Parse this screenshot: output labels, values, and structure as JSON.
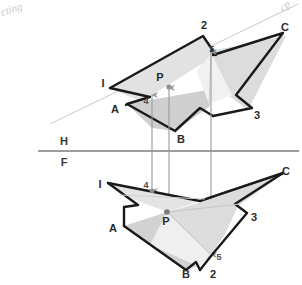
{
  "sheet": {
    "background_color": "#ffffff",
    "width": 302,
    "height": 285,
    "title": "Descriptive geometry: two views of two intersecting planes with piercing point P"
  },
  "colors": {
    "outline": "#1a1a1a",
    "light_fill": "#e3e3e3",
    "mid_fill": "#cfcfcf",
    "dark_fill": "#bdbdbd",
    "pale_fill": "#f0f0f0",
    "projector": "#9a9a9a",
    "reference_line": "#7d7d7d",
    "trace_line": "#c0c0c0",
    "label_text": "#2b2b2b",
    "pencil_scribble": "#c9c9c9"
  },
  "reference_line": {
    "name": "H-F fold line",
    "upper_label": "H",
    "lower_label": "F",
    "y": 151,
    "x_start": 38,
    "x_end": 299,
    "upper_label_x": 64,
    "upper_label_y": 142,
    "lower_label_x": 64,
    "lower_label_y": 162
  },
  "top_view": {
    "name": "horizontal-projection",
    "labels": [
      {
        "text": "2",
        "x": 204,
        "y": 26,
        "size": "large"
      },
      {
        "text": "C",
        "x": 285,
        "y": 28,
        "size": "large"
      },
      {
        "text": "5",
        "x": 212,
        "y": 50,
        "size": "small"
      },
      {
        "text": "I",
        "x": 103,
        "y": 84,
        "size": "large"
      },
      {
        "text": "P",
        "x": 160,
        "y": 78,
        "size": "large"
      },
      {
        "text": "A",
        "x": 115,
        "y": 110,
        "size": "large"
      },
      {
        "text": "4",
        "x": 146,
        "y": 102,
        "size": "small"
      },
      {
        "text": "3",
        "x": 257,
        "y": 116,
        "size": "large"
      },
      {
        "text": "B",
        "x": 181,
        "y": 140,
        "size": "large"
      }
    ],
    "piercing_point": {
      "label": "P",
      "x": 168,
      "y": 87
    }
  },
  "front_view": {
    "name": "frontal-projection",
    "labels": [
      {
        "text": "C",
        "x": 286,
        "y": 172,
        "size": "large"
      },
      {
        "text": "I",
        "x": 100,
        "y": 185,
        "size": "large"
      },
      {
        "text": "4",
        "x": 146,
        "y": 186,
        "size": "small"
      },
      {
        "text": "3",
        "x": 254,
        "y": 218,
        "size": "large"
      },
      {
        "text": "P",
        "x": 166,
        "y": 222,
        "size": "large"
      },
      {
        "text": "A",
        "x": 113,
        "y": 229,
        "size": "large"
      },
      {
        "text": "5",
        "x": 219,
        "y": 258,
        "size": "small"
      },
      {
        "text": "B",
        "x": 186,
        "y": 275,
        "size": "large"
      },
      {
        "text": "2",
        "x": 213,
        "y": 275,
        "size": "large"
      }
    ],
    "piercing_point": {
      "label": "P",
      "x": 167,
      "y": 212
    }
  },
  "projectors": [
    {
      "name": "projector-point-4",
      "x": 152,
      "top_y": 95,
      "bottom_y": 191,
      "arrows": "both"
    },
    {
      "name": "projector-point-P",
      "x": 169,
      "top_y": 88,
      "bottom_y": 213,
      "arrows": "both"
    },
    {
      "name": "projector-point-5",
      "x": 211,
      "top_y": 52,
      "bottom_y": 255,
      "arrows": "both"
    }
  ],
  "annotations": [
    {
      "name": "pencil-note-top-left",
      "text": "cting",
      "x": 2,
      "y": 16,
      "rotation": -18
    },
    {
      "name": "pencil-note-top-right",
      "text": "cp",
      "x": 283,
      "y": 12,
      "rotation": -40
    }
  ]
}
